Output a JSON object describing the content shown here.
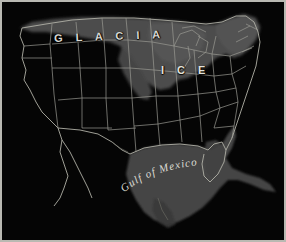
{
  "map": {
    "title": "Glacial Ice Map of the United States",
    "region": "United States and Gulf of Mexico",
    "labels": {
      "glacial_line1": "G L A C I A",
      "glacial_line2": "L",
      "ice": "I C E",
      "gulf": "Gulf of Mexico"
    },
    "colors": {
      "background": "#050505",
      "land": "#070707",
      "ice_fill": "#4e4e4e",
      "water_fill": "#4a4a4a",
      "shelf_fill": "#3a3a3a",
      "border_line": "#9a9a92",
      "coastline": "#b0b0a6",
      "frame": "#b9b9b2",
      "label_text": "#dcdcd4"
    },
    "legend_items": [
      {
        "label": "GLACIAL ICE",
        "swatch": "#4e4e4e"
      },
      {
        "label": "Gulf of Mexico",
        "swatch": "#4a4a4a"
      }
    ]
  }
}
